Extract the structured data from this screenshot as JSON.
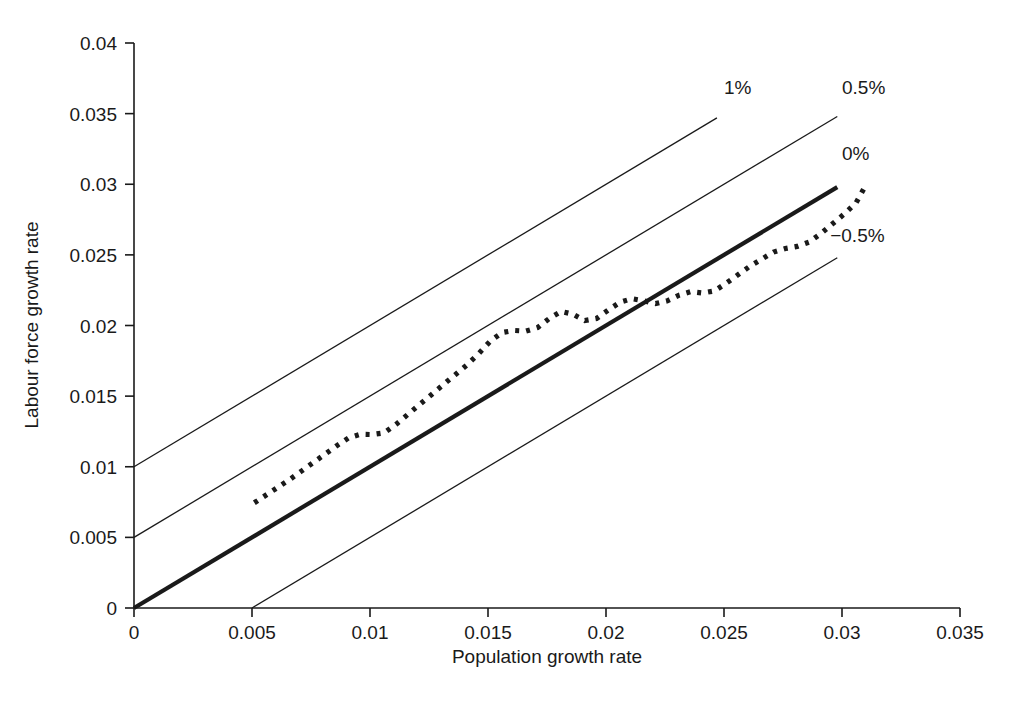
{
  "chart_data": {
    "type": "line",
    "title": "",
    "xlabel": "Population growth rate",
    "ylabel": "Labour force growth rate",
    "xlim": [
      0,
      0.035
    ],
    "ylim": [
      0,
      0.04
    ],
    "xticks": [
      "0",
      "0.005",
      "0.01",
      "0.015",
      "0.02",
      "0.025",
      "0.03",
      "0.035"
    ],
    "xtick_values": [
      0,
      0.005,
      0.01,
      0.015,
      0.02,
      0.025,
      0.03,
      0.035
    ],
    "yticks": [
      "0",
      "0.005",
      "0.01",
      "0.015",
      "0.02",
      "0.025",
      "0.03",
      "0.035",
      "0.04"
    ],
    "ytick_values": [
      0,
      0.005,
      0.01,
      0.015,
      0.02,
      0.025,
      0.03,
      0.035,
      0.04
    ],
    "grid": false,
    "legend_position": "inline-annotations",
    "series": [
      {
        "name": "Labour force growth rate vs population growth rate",
        "style": "dotted",
        "x": [
          0.0051,
          0.0056,
          0.0061,
          0.0066,
          0.0071,
          0.0076,
          0.0081,
          0.0086,
          0.0091,
          0.0096,
          0.0101,
          0.0106,
          0.0111,
          0.0116,
          0.0121,
          0.0126,
          0.0131,
          0.0136,
          0.0141,
          0.0146,
          0.0151,
          0.0156,
          0.0161,
          0.0166,
          0.0171,
          0.0176,
          0.0181,
          0.0186,
          0.0191,
          0.0196,
          0.0201,
          0.0206,
          0.0211,
          0.0216,
          0.0221,
          0.0226,
          0.0231,
          0.0236,
          0.0241,
          0.0246,
          0.0251,
          0.0256,
          0.0261,
          0.0266,
          0.0271,
          0.0276,
          0.0281,
          0.0286,
          0.0291,
          0.0296,
          0.0301,
          0.0306,
          0.031
        ],
        "y": [
          0.00745,
          0.008,
          0.00855,
          0.0091,
          0.0097,
          0.0103,
          0.0109,
          0.0115,
          0.01205,
          0.0123,
          0.01228,
          0.0124,
          0.013,
          0.0137,
          0.0144,
          0.0151,
          0.0158,
          0.0165,
          0.0172,
          0.018,
          0.0189,
          0.0195,
          0.01965,
          0.0196,
          0.01985,
          0.0205,
          0.021,
          0.0208,
          0.02035,
          0.0205,
          0.0211,
          0.02165,
          0.0219,
          0.02175,
          0.02155,
          0.02175,
          0.02215,
          0.0224,
          0.0223,
          0.02245,
          0.023,
          0.0236,
          0.0242,
          0.0247,
          0.0252,
          0.02545,
          0.0256,
          0.0259,
          0.0265,
          0.0272,
          0.0279,
          0.0287,
          0.0299
        ]
      }
    ],
    "reference_lines": [
      {
        "label": "1%",
        "intercept": 0.01,
        "slope": 1,
        "x_start": 0.0,
        "x_end": 0.0247,
        "style": "thin",
        "label_x": 0.025,
        "label_y": 0.0364
      },
      {
        "label": "0.5%",
        "intercept": 0.005,
        "slope": 1,
        "x_start": 0.0,
        "x_end": 0.0298,
        "style": "thin",
        "label_x": 0.03,
        "label_y": 0.0364
      },
      {
        "label": "0%",
        "intercept": 0.0,
        "slope": 1,
        "x_start": 0.0,
        "x_end": 0.0298,
        "style": "bold",
        "label_x": 0.03,
        "label_y": 0.0317
      },
      {
        "label": "−0.5%",
        "intercept": -0.005,
        "slope": 1,
        "x_start": 0.005,
        "x_end": 0.0298,
        "style": "thin",
        "label_x": 0.0295,
        "label_y": 0.0259
      }
    ]
  },
  "axes": {
    "x_title": "Population growth rate",
    "y_title": "Labour force growth rate"
  },
  "colors": {
    "foreground": "#1a1a1a",
    "background": "#ffffff"
  }
}
